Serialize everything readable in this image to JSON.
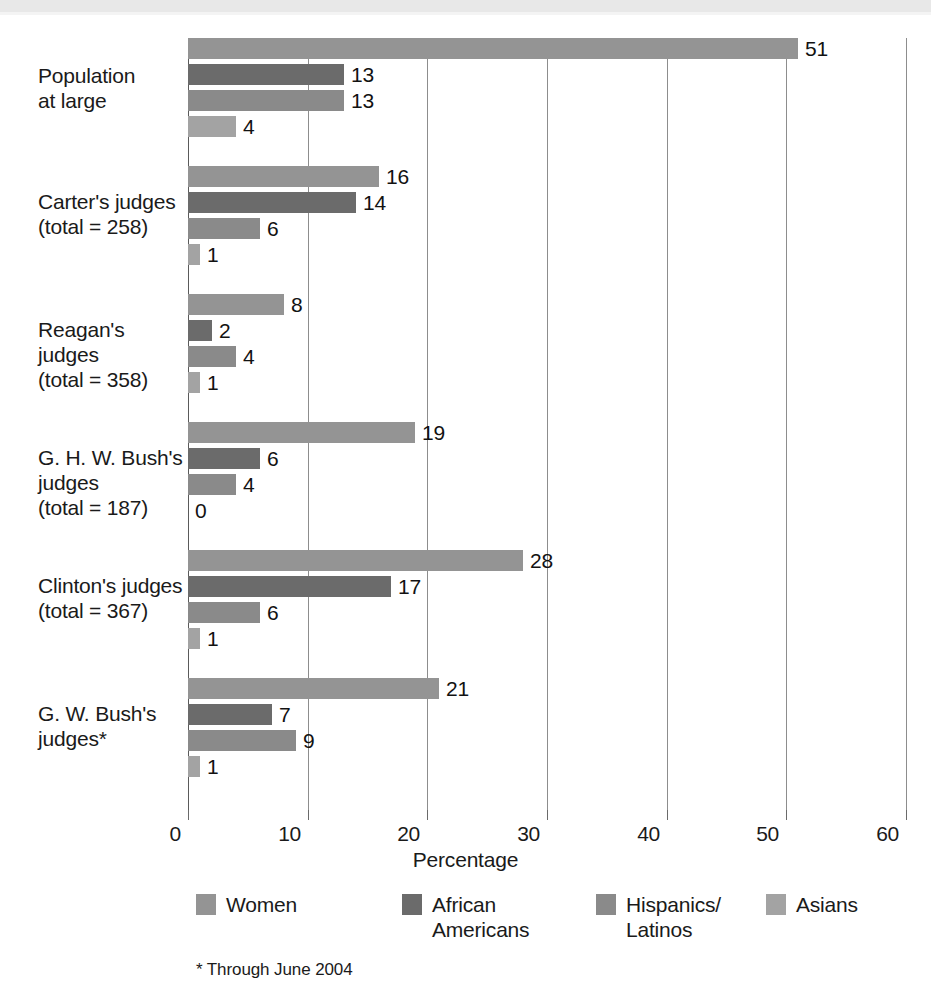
{
  "chart_data": {
    "type": "bar",
    "orientation": "horizontal",
    "title": "",
    "xlabel": "Percentage",
    "ylabel": "",
    "xlim": [
      0,
      60
    ],
    "xticks": [
      0,
      10,
      20,
      30,
      40,
      50,
      60
    ],
    "xtick_labels": [
      "0",
      "10",
      "20",
      "30",
      "40",
      "50",
      "60"
    ],
    "grid": "vertical",
    "legend_position": "bottom",
    "footnote": "* Through June 2004",
    "categories": [
      "Population\nat large",
      "Carter's judges\n(total = 258)",
      "Reagan's judges\n(total = 358)",
      "G. H. W. Bush's\njudges\n(total = 187)",
      "Clinton's judges\n(total = 367)",
      "G. W. Bush's\njudges*"
    ],
    "series": [
      {
        "name": "Women",
        "color": "#949494",
        "values": [
          51,
          16,
          8,
          19,
          28,
          21
        ],
        "labels": [
          "51",
          "16",
          "8",
          "19",
          "28",
          "21"
        ]
      },
      {
        "name": "African\nAmericans",
        "color": "#6b6b6b",
        "values": [
          13,
          14,
          2,
          6,
          17,
          7
        ],
        "labels": [
          "13",
          "14",
          "2",
          "6",
          "17",
          "7"
        ]
      },
      {
        "name": "Hispanics/\nLatinos",
        "color": "#8a8a8a",
        "values": [
          13,
          6,
          4,
          4,
          6,
          9
        ],
        "labels": [
          "13",
          "6",
          "4",
          "4",
          "6",
          "9"
        ]
      },
      {
        "name": "Asians",
        "color": "#a3a3a3",
        "values": [
          4,
          1,
          1,
          0,
          1,
          1
        ],
        "labels": [
          "4",
          "1",
          "1",
          "0",
          "1",
          "1"
        ]
      }
    ]
  }
}
